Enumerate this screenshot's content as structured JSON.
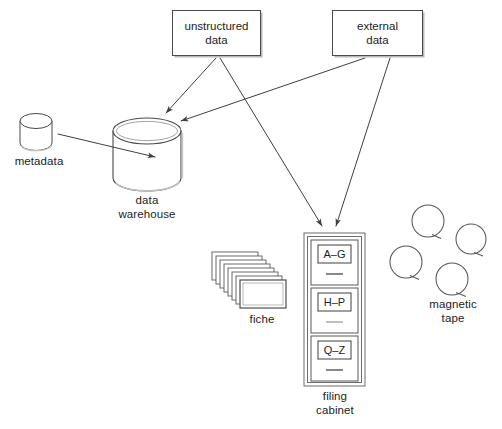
{
  "diagram": {
    "background_color": "#ffffff",
    "line_color": "#3f3f3f",
    "text_color": "#1d1d1d",
    "shadow_color": "#b9b9b9"
  },
  "sources": [
    {
      "id": "unstructured-data",
      "label": "unstructured\ndata",
      "x": 172,
      "y": 10,
      "w": 89,
      "h": 46
    },
    {
      "id": "external-data",
      "label": "external\ndata",
      "x": 332,
      "y": 10,
      "w": 91,
      "h": 46
    }
  ],
  "stores": {
    "metadata": {
      "label": "metadata",
      "x": 20,
      "y": 113,
      "w": 32,
      "h": 37
    },
    "data_warehouse": {
      "label": "data\nwarehouse",
      "x": 113,
      "y": 118,
      "w": 68,
      "h": 73
    }
  },
  "fiche": {
    "label": "fiche",
    "card_count": 8,
    "x": 212,
    "y": 252,
    "card_w": 46,
    "card_h": 28
  },
  "filing_cabinet": {
    "label": "filing\ncabinet",
    "x": 304,
    "y": 233,
    "w": 61,
    "h": 153,
    "drawers": [
      {
        "label": "A–G"
      },
      {
        "label": "H–P"
      },
      {
        "label": "Q–Z"
      }
    ]
  },
  "magnetic_tape": {
    "label": "magnetic\ntape",
    "reel_count": 4,
    "reels": [
      {
        "cx": 428,
        "cy": 221,
        "r": 16
      },
      {
        "cx": 471,
        "cy": 239,
        "r": 15
      },
      {
        "cx": 406,
        "cy": 262,
        "r": 16
      },
      {
        "cx": 452,
        "cy": 279,
        "r": 16
      }
    ]
  },
  "arrows": [
    {
      "id": "metadata-to-warehouse",
      "from": "metadata",
      "to": "data warehouse"
    },
    {
      "id": "unstructured-to-warehouse",
      "from": "unstructured data",
      "to": "data warehouse"
    },
    {
      "id": "unstructured-to-cabinet",
      "from": "unstructured data",
      "to": "filing cabinet"
    },
    {
      "id": "external-to-warehouse",
      "from": "external data",
      "to": "data warehouse"
    },
    {
      "id": "external-to-cabinet",
      "from": "external data",
      "to": "filing cabinet"
    }
  ]
}
